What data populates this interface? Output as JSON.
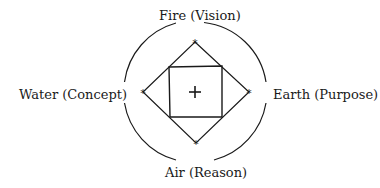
{
  "diagram": {
    "labels": {
      "top": "Fire (Vision)",
      "left": "Water (Concept)",
      "right": "Earth (Purpose)",
      "bottom": "Air (Reason)"
    },
    "center_symbol": "+",
    "vertex_symbol": "*",
    "stroke_color": "#1a1a1a"
  }
}
